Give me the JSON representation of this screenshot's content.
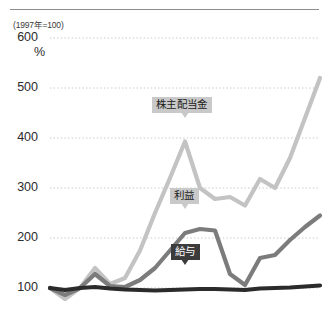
{
  "figure": {
    "base_note": "(1997年=100)",
    "unit_label": "%"
  },
  "chart_data": {
    "type": "line",
    "title": "",
    "subtitle": "",
    "xlabel": "",
    "ylabel": "%",
    "base_note": "(1997年=100)",
    "ylim": [
      60,
      600
    ],
    "yticks": [
      100,
      200,
      300,
      400,
      500,
      600
    ],
    "ytick_labels": [
      "100",
      "200",
      "300",
      "400",
      "500",
      "600"
    ],
    "grid": true,
    "grid_style": "dotted",
    "legend_position": "inline-callouts",
    "x": [
      0,
      1,
      2,
      3,
      4,
      5,
      6,
      7,
      8,
      9,
      10,
      11,
      12,
      13,
      14,
      15,
      16,
      17,
      18
    ],
    "series": [
      {
        "name": "株主配当金",
        "label": "株主配当金",
        "color": "#c3c3c3",
        "values": [
          100,
          78,
          100,
          140,
          108,
          120,
          175,
          250,
          320,
          393,
          300,
          278,
          282,
          265,
          318,
          300,
          360,
          440,
          520
        ]
      },
      {
        "name": "利益",
        "label": "利益",
        "color": "#7c7c7c",
        "values": [
          100,
          86,
          100,
          128,
          104,
          102,
          116,
          140,
          175,
          210,
          218,
          215,
          128,
          106,
          160,
          166,
          196,
          222,
          245
        ]
      },
      {
        "name": "給与",
        "label": "給与",
        "color": "#2b2b2b",
        "values": [
          100,
          96,
          100,
          102,
          99,
          97,
          96,
          95,
          96,
          97,
          98,
          98,
          97,
          96,
          99,
          100,
          101,
          103,
          105
        ]
      }
    ],
    "annotations": [
      {
        "text": "株主配当金",
        "series": "株主配当金",
        "x": 9,
        "style": "light"
      },
      {
        "text": "利益",
        "series": "利益",
        "x": 9,
        "style": "light"
      },
      {
        "text": "給与",
        "series": "給与",
        "x": 9,
        "style": "dark"
      }
    ]
  },
  "colors": {
    "dividends": "#c3c3c3",
    "profit": "#7c7c7c",
    "salary": "#2b2b2b",
    "grid": "#c8c8c8",
    "rule": "#8d8d8d",
    "text": "#2b2b2b"
  }
}
